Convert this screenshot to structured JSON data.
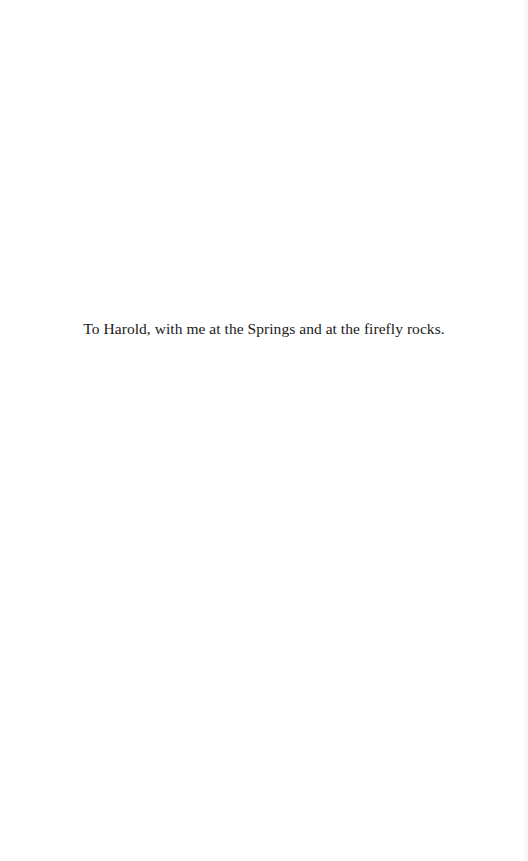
{
  "page": {
    "dedication": "To Harold, with me at the Springs and at the firefly rocks."
  }
}
